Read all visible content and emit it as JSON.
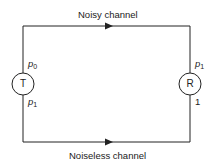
{
  "diagram": {
    "top_channel_label": "Noisy channel",
    "bottom_channel_label": "Noiseless channel",
    "transmitter": {
      "label": "T",
      "top_prob": "p",
      "top_prob_sub": "0",
      "bottom_prob": "p",
      "bottom_prob_sub": "1"
    },
    "receiver": {
      "label": "R",
      "top_prob": "p",
      "top_prob_sub": "1",
      "bottom_value": "1"
    },
    "line_color": "#222222"
  }
}
